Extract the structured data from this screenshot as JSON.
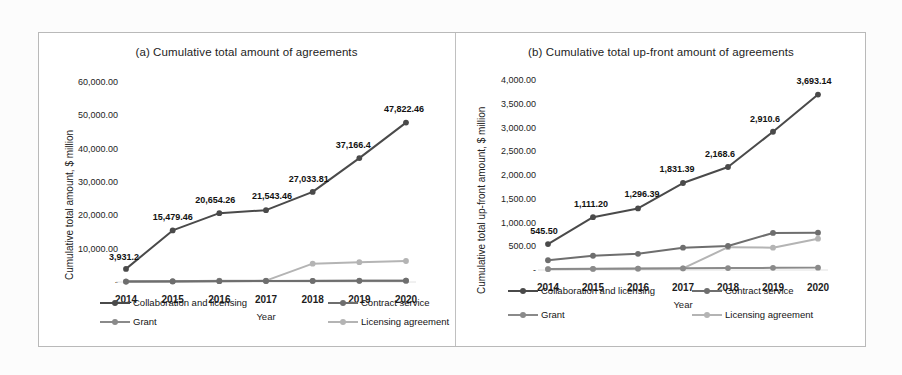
{
  "figure": {
    "background": "#ffffff",
    "frame_color": "#b9b9b9"
  },
  "series_colors": {
    "collaboration_and_licensing": "#4a4a4a",
    "contract_service": "#6e6e6e",
    "grant": "#8a8a8a",
    "licensing_agreement": "#b4b4b4"
  },
  "panel_a": {
    "title": "(a) Cumulative total amount of agreements",
    "ylabel": "Cumulative total amount, $ million",
    "xlabel": "Year",
    "yticks": [
      "60,000.00",
      "50,000.00",
      "40,000.00",
      "30,000.00",
      "20,000.00",
      "10,000.00",
      "-"
    ],
    "xticks": [
      "2014",
      "2015",
      "2016",
      "2017",
      "2018",
      "2019",
      "2020"
    ],
    "data_labels": [
      "3,931.2",
      "15,479.46",
      "20,654.26",
      "21,543.46",
      "27,033.81",
      "37,166.4",
      "47,822.46"
    ],
    "legend": [
      "Collaboration and licensing",
      "Contract service",
      "Grant",
      "Licensing agreement"
    ]
  },
  "panel_b": {
    "title": "(b) Cumulative total up-front amount of agreements",
    "ylabel": "Cumulative total up-front amount, $ million",
    "xlabel": "Year",
    "yticks": [
      "4,000.00",
      "3,500.00",
      "3,000.00",
      "2,500.00",
      "2,000.00",
      "1,500.00",
      "1,000.00",
      "500.00",
      "-"
    ],
    "xticks": [
      "2014",
      "2015",
      "2016",
      "2017",
      "2018",
      "2019",
      "2020"
    ],
    "data_labels": [
      "545.50",
      "1,111.20",
      "1,296.39",
      "1,831.39",
      "2,168.6",
      "2,910.6",
      "3,693.14"
    ],
    "legend": [
      "Collaboration and licensing",
      "Contract service",
      "Grant",
      "Licensing agreement"
    ]
  },
  "chart_data": [
    {
      "type": "line",
      "panel": "a",
      "title": "(a) Cumulative total amount of agreements",
      "xlabel": "Year",
      "ylabel": "Cumulative total amount, $ million",
      "categories": [
        "2014",
        "2015",
        "2016",
        "2017",
        "2018",
        "2019",
        "2020"
      ],
      "ylim": [
        0,
        60000
      ],
      "ytick_values": [
        0,
        10000,
        20000,
        30000,
        40000,
        50000,
        60000
      ],
      "grid": false,
      "legend_position": "bottom",
      "series": [
        {
          "name": "Collaboration and licensing",
          "color": "#4a4a4a",
          "values": [
            3931.2,
            15479.46,
            20654.26,
            21543.46,
            27033.81,
            37166.4,
            47822.46
          ],
          "labels": [
            "3,931.2",
            "15,479.46",
            "20,654.26",
            "21,543.46",
            "27,033.81",
            "37,166.4",
            "47,822.46"
          ]
        },
        {
          "name": "Contract service",
          "color": "#6e6e6e",
          "values": [
            120,
            180,
            260,
            300,
            330,
            360,
            390
          ]
        },
        {
          "name": "Grant",
          "color": "#8a8a8a",
          "values": [
            140,
            200,
            300,
            330,
            360,
            380,
            400
          ]
        },
        {
          "name": "Licensing agreement",
          "color": "#b4b4b4",
          "values": [
            150,
            230,
            380,
            420,
            5500,
            5950,
            6300
          ]
        }
      ]
    },
    {
      "type": "line",
      "panel": "b",
      "title": "(b) Cumulative total up-front amount of agreements",
      "xlabel": "Year",
      "ylabel": "Cumulative total up-front amount, $ million",
      "categories": [
        "2014",
        "2015",
        "2016",
        "2017",
        "2018",
        "2019",
        "2020"
      ],
      "ylim": [
        0,
        4000
      ],
      "ytick_values": [
        0,
        500,
        1000,
        1500,
        2000,
        2500,
        3000,
        3500,
        4000
      ],
      "grid": false,
      "legend_position": "bottom",
      "series": [
        {
          "name": "Collaboration and licensing",
          "color": "#4a4a4a",
          "values": [
            545.5,
            1111.2,
            1296.39,
            1831.39,
            2168.6,
            2910.6,
            3693.14
          ],
          "labels": [
            "545.50",
            "1,111.20",
            "1,296.39",
            "1,831.39",
            "2,168.6",
            "2,910.6",
            "3,693.14"
          ]
        },
        {
          "name": "Contract service",
          "color": "#6e6e6e",
          "values": [
            205,
            300,
            340,
            470,
            505,
            780,
            785
          ]
        },
        {
          "name": "Grant",
          "color": "#8a8a8a",
          "values": [
            20,
            25,
            30,
            35,
            40,
            45,
            50
          ]
        },
        {
          "name": "Licensing agreement",
          "color": "#b4b4b4",
          "values": [
            18,
            22,
            28,
            34,
            480,
            470,
            660
          ]
        }
      ]
    }
  ]
}
